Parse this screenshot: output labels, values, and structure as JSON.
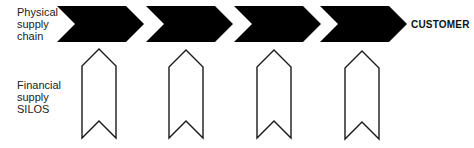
{
  "diagram": {
    "physical_label": [
      "Physical",
      "supply",
      "chain"
    ],
    "financial_label": [
      "Financial",
      "supply",
      "SILOS"
    ],
    "endpoint_label": "CUSTOMER",
    "colors": {
      "chevron_fill": "#000000",
      "silo_stroke": "#1a1a1a",
      "silo_fill": "#ffffff",
      "text": "#222222"
    },
    "physical_chevrons": [
      {
        "index": 1,
        "direction": "right",
        "fill": "solid"
      },
      {
        "index": 2,
        "direction": "right",
        "fill": "solid"
      },
      {
        "index": 3,
        "direction": "right",
        "fill": "solid"
      },
      {
        "index": 4,
        "direction": "right",
        "fill": "solid"
      }
    ],
    "financial_silos": [
      {
        "index": 1,
        "direction": "up",
        "fill": "outline"
      },
      {
        "index": 2,
        "direction": "up",
        "fill": "outline"
      },
      {
        "index": 3,
        "direction": "up",
        "fill": "outline"
      },
      {
        "index": 4,
        "direction": "up",
        "fill": "outline"
      }
    ]
  }
}
